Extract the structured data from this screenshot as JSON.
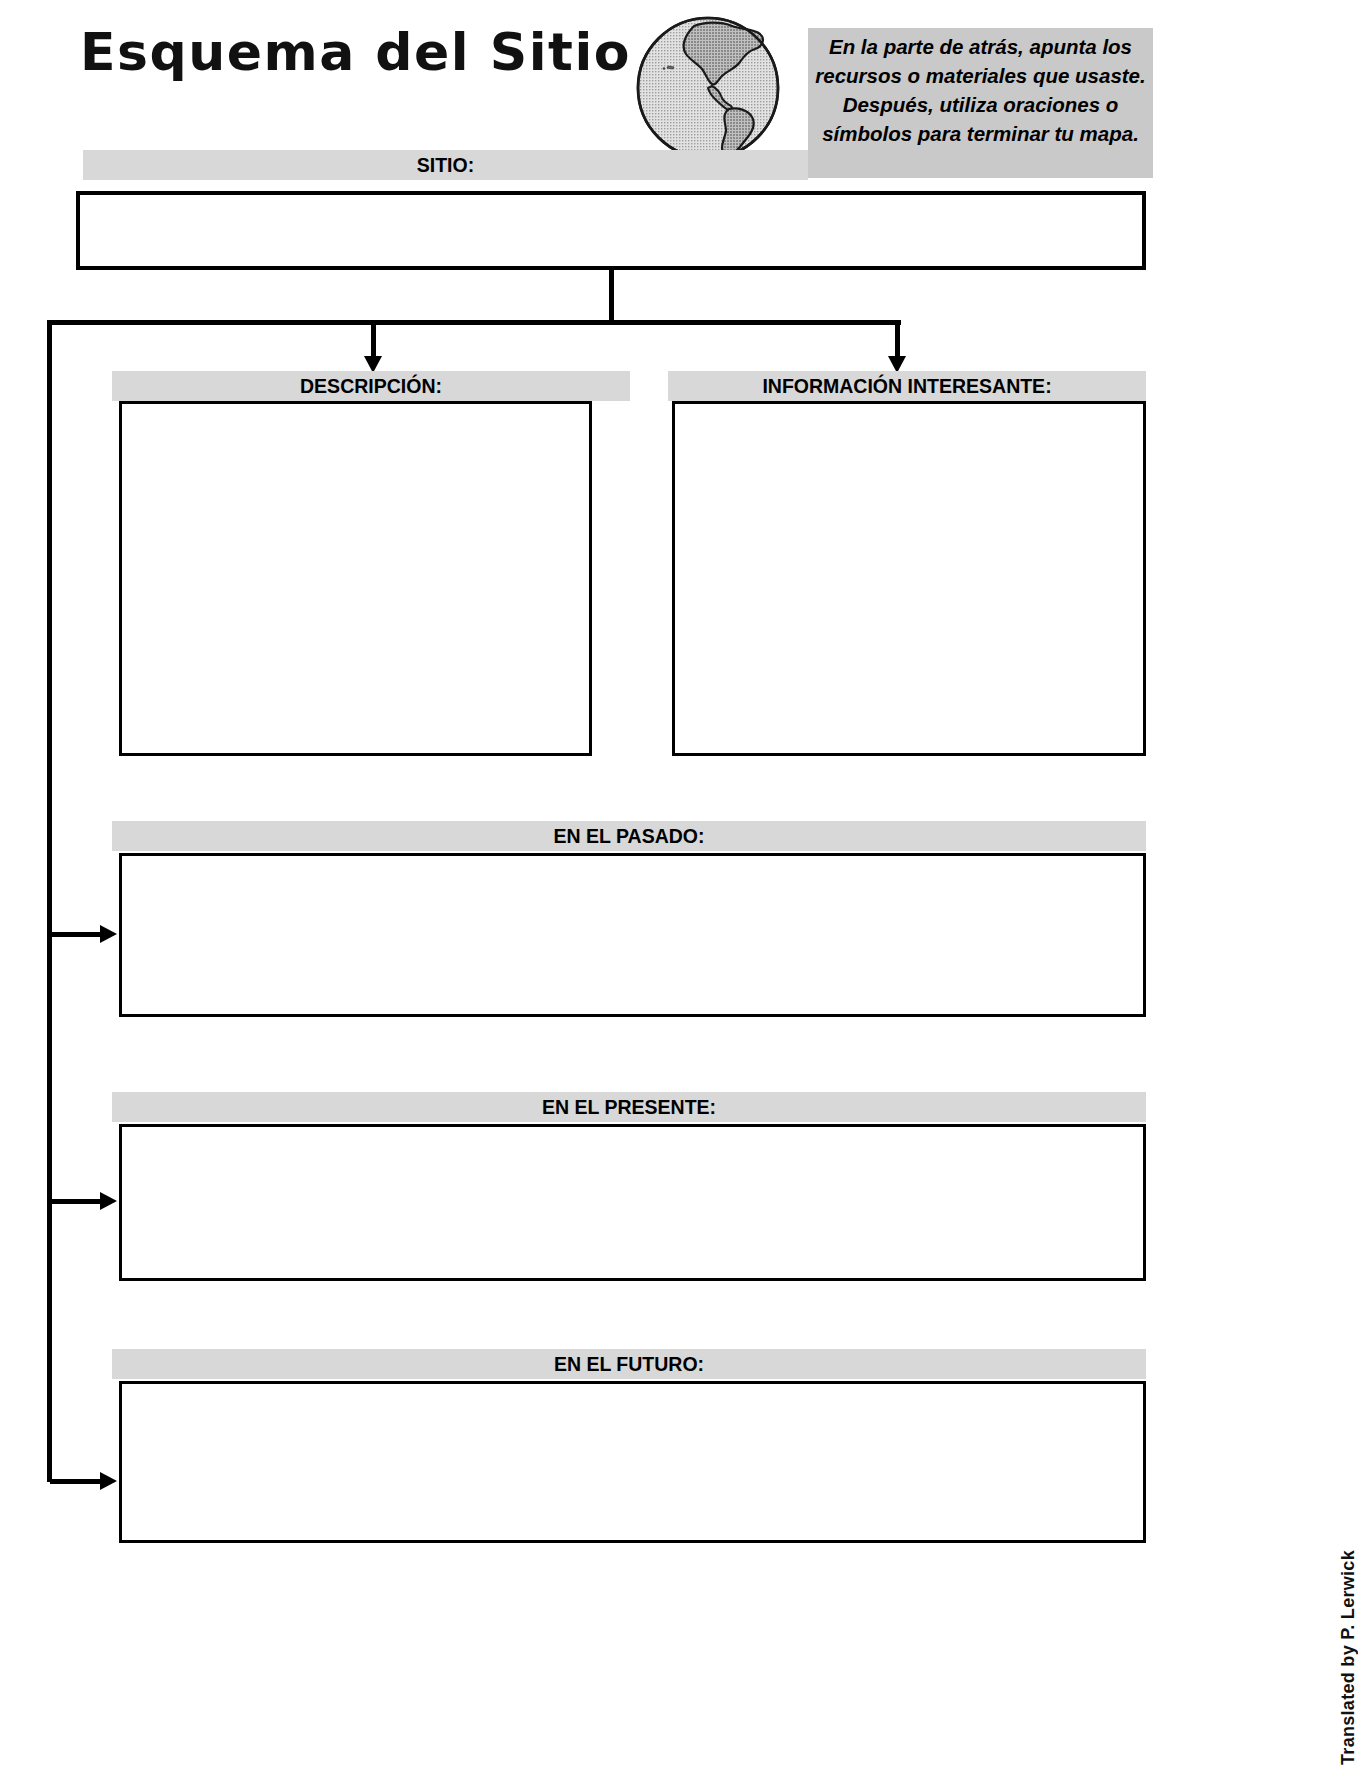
{
  "header": {
    "title": "Esquema del Sitio",
    "globe_icon": "globe-americas-icon",
    "note": "En la parte de atrás, apunta los recursos o materiales que usaste.  Después, utiliza oraciones o símbolos para terminar tu mapa."
  },
  "sections": {
    "site": {
      "label": "SITIO:",
      "value": ""
    },
    "description": {
      "label": "DESCRIPCIÓN:",
      "value": ""
    },
    "interesting": {
      "label": "INFORMACIÓN INTERESANTE:",
      "value": ""
    },
    "past": {
      "label": "EN EL PASADO:",
      "value": ""
    },
    "present": {
      "label": "EN EL PRESENTE:",
      "value": ""
    },
    "future": {
      "label": "EN EL FUTURO:",
      "value": ""
    }
  },
  "credit": "Translated by P. Lerwick",
  "footer": "",
  "colors": {
    "bar_gray": "#d8d8d8",
    "note_gray": "#c9c9c9",
    "ink": "#000000",
    "globe_land": "#9a9a9a",
    "globe_ocean": "#cfcfcf"
  }
}
